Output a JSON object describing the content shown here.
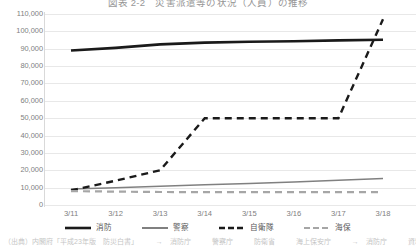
{
  "chart_data": {
    "type": "line",
    "title": "図表 2-2　災害派遣等の状況（人員）の推移",
    "xlabel": "",
    "ylabel": "",
    "categories": [
      "3/11",
      "3/12",
      "3/13",
      "3/14",
      "3/15",
      "3/16",
      "3/17",
      "3/18"
    ],
    "ylim": [
      0,
      110000
    ],
    "ytick_values": [
      0,
      10000,
      20000,
      30000,
      40000,
      50000,
      60000,
      70000,
      80000,
      90000,
      100000,
      110000
    ],
    "ytick_labels": [
      "0",
      "10,000",
      "20,000",
      "30,000",
      "40,000",
      "50,000",
      "60,000",
      "70,000",
      "80,000",
      "90,000",
      "100,000",
      "110,000"
    ],
    "grid": true,
    "legend_position": "bottom",
    "series": [
      {
        "name": "消防",
        "style": "solid",
        "color": "#1a1a1a",
        "width": 2.6,
        "values": [
          89000,
          90500,
          92500,
          93500,
          94000,
          94300,
          94800,
          95200
        ]
      },
      {
        "name": "警察",
        "style": "solid",
        "color": "#808080",
        "width": 1.5,
        "values": [
          9200,
          10000,
          10800,
          11600,
          12400,
          13200,
          14200,
          15200
        ]
      },
      {
        "name": "自衛隊",
        "style": "dashed",
        "color": "#1a1a1a",
        "width": 2.4,
        "values": [
          8400,
          14000,
          20000,
          50000,
          50000,
          50000,
          50000,
          107000
        ]
      },
      {
        "name": "海保",
        "style": "dashed",
        "color": "#a6a6a6",
        "width": 2.2,
        "values": [
          8000,
          7700,
          7500,
          7400,
          7400,
          7400,
          7400,
          7400
        ]
      }
    ]
  },
  "footnote": "（出典）内閣府「平成23年版　防災白書」　　　→　消防庁　　　警察庁　　　防衛省　　　海上保安庁　　　→　消防庁　　　資料"
}
